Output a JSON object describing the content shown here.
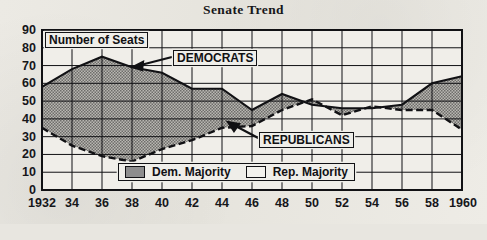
{
  "title": "Senate Trend",
  "axis_note": "Number of Seats",
  "annotations": {
    "democrats": "DEMOCRATS",
    "republicans": "REPUBLICANS"
  },
  "legend": {
    "dem_label": "Dem. Majority",
    "rep_label": "Rep. Majority"
  },
  "colors": {
    "ink": "#111114",
    "dem_fill": "#8d8d8d",
    "paper": "#e8e6e0"
  },
  "chart_data": {
    "type": "line",
    "title": "Senate Trend",
    "xlabel": "",
    "ylabel": "Number of Seats",
    "ylim": [
      0,
      90
    ],
    "ytick_step": 10,
    "yticks": [
      0,
      10,
      20,
      30,
      40,
      50,
      60,
      70,
      80,
      90
    ],
    "grid": true,
    "legend_position": "bottom-center",
    "x": [
      1932,
      1934,
      1936,
      1938,
      1940,
      1942,
      1944,
      1946,
      1948,
      1950,
      1952,
      1954,
      1956,
      1958,
      1960
    ],
    "categories": [
      "1932",
      "34",
      "36",
      "38",
      "40",
      "42",
      "44",
      "46",
      "48",
      "50",
      "52",
      "54",
      "56",
      "58",
      "1960"
    ],
    "series": [
      {
        "name": "DEMOCRATS",
        "style": "solid",
        "values": [
          58,
          68,
          75,
          69,
          66,
          57,
          57,
          45,
          54,
          48,
          46,
          46,
          48,
          60,
          64
        ]
      },
      {
        "name": "REPUBLICANS",
        "style": "dashed",
        "values": [
          35,
          25,
          19,
          16,
          23,
          28,
          35,
          36,
          45,
          51,
          42,
          47,
          45,
          45,
          34
        ]
      }
    ],
    "fill_between": "shaded between the two series; hatched/gray where Democrats lead (Dem. Majority), white where Republicans lead (Rep. Majority)"
  }
}
